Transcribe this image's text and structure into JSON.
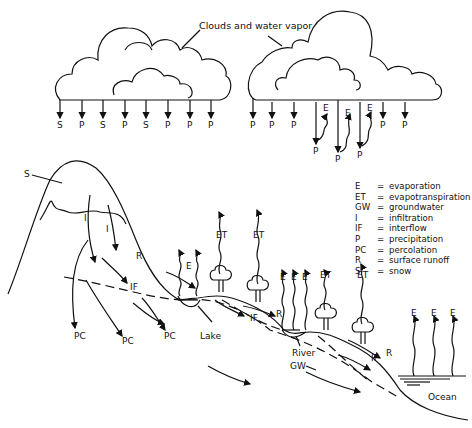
{
  "diagram": {
    "title_label": "Clouds and water vapor",
    "cloud_left_drops": [
      "S",
      "P",
      "S",
      "P",
      "S",
      "P",
      "P",
      "P"
    ],
    "cloud_right_drops": [
      "P",
      "P",
      "P",
      "E",
      "P",
      "E",
      "P",
      "E",
      "P",
      "P",
      "P"
    ],
    "legend": [
      {
        "abbr": "E",
        "def": "evaporation"
      },
      {
        "abbr": "ET",
        "def": "evapotranspiration"
      },
      {
        "abbr": "GW",
        "def": "groundwater"
      },
      {
        "abbr": "I",
        "def": "infiltration"
      },
      {
        "abbr": "IF",
        "def": "interflow"
      },
      {
        "abbr": "P",
        "def": "precipitation"
      },
      {
        "abbr": "PC",
        "def": "percolation"
      },
      {
        "abbr": "R",
        "def": "surface runoff"
      },
      {
        "abbr": "S",
        "def": "snow"
      }
    ],
    "labels": {
      "snow": "S",
      "infiltration_1": "I",
      "infiltration_2": "I",
      "runoff_1": "R",
      "runoff_2": "R",
      "runoff_3": "R",
      "interflow_1": "IF",
      "interflow_2": "IF",
      "interflow_3": "IF",
      "evap_lake": "E",
      "et_1": "ET",
      "et_2": "ET",
      "et_3": "ET",
      "et_4": "ET",
      "evap_river_1": "E",
      "evap_river_2": "E",
      "evap_river_3": "E",
      "evap_ocean_1": "E",
      "evap_ocean_2": "E",
      "evap_ocean_3": "E",
      "pc_1": "PC",
      "pc_2": "PC",
      "pc_3": "PC",
      "lake": "Lake",
      "river": "River",
      "groundwater": "GW",
      "ocean": "Ocean"
    }
  }
}
